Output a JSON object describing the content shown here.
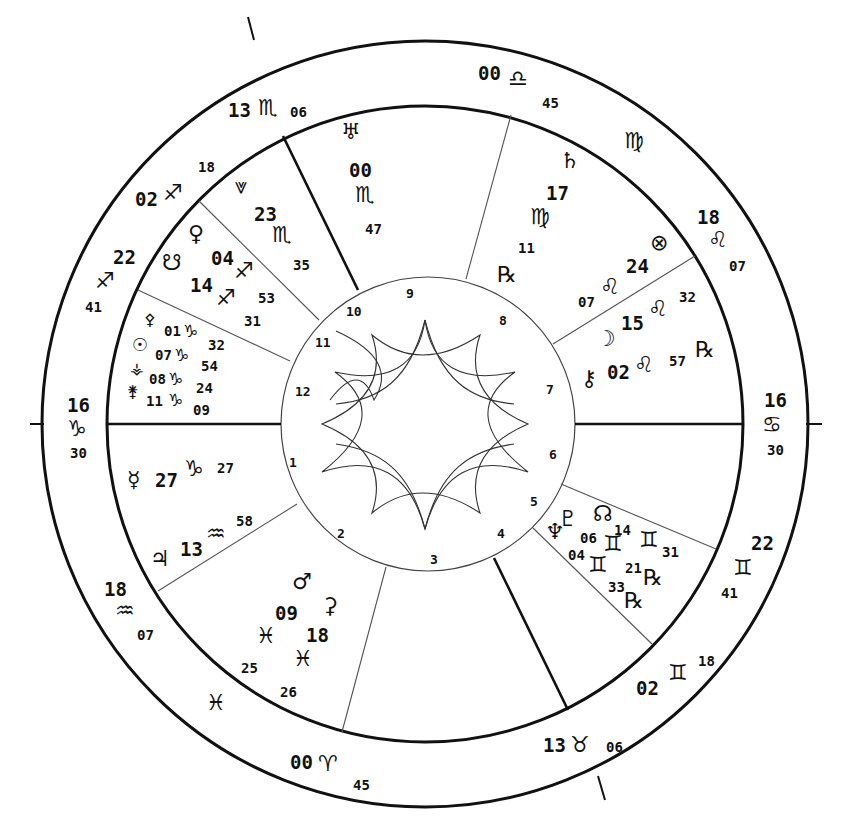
{
  "chart_title": "Natal astrology wheel",
  "colors": {
    "ink": "#111111",
    "background": "#ffffff",
    "thin_line": "#555555"
  },
  "angles": {
    "asc": {
      "deg": "16",
      "sign": "♑",
      "min": "30"
    },
    "dsc": {
      "deg": "16",
      "sign": "♋",
      "min": "30"
    },
    "mc": {
      "deg": "13",
      "sign": "♏",
      "min": "06"
    },
    "ic": {
      "deg": "13",
      "sign": "♉",
      "min": "06"
    }
  },
  "cusps": {
    "c11": {
      "deg": "02",
      "sign": "♐",
      "min": "18"
    },
    "c12": {
      "deg": "22",
      "sign": "♐",
      "min": "41"
    },
    "c2": {
      "deg": "18",
      "sign": "♒",
      "min": "07"
    },
    "c3": {
      "deg": "00",
      "sign": "♈",
      "min": "45"
    },
    "c5": {
      "deg": "02",
      "sign": "♊",
      "min": "18"
    },
    "c6": {
      "deg": "22",
      "sign": "♊",
      "min": "41"
    },
    "c8": {
      "deg": "18",
      "sign": "♌",
      "min": "07"
    },
    "c9": {
      "deg": "00",
      "sign": "♎",
      "min": "45"
    }
  },
  "intercepted_signs": {
    "virgo": "♍",
    "pisces": "♓"
  },
  "house_numbers": [
    "1",
    "2",
    "3",
    "4",
    "5",
    "6",
    "7",
    "8",
    "9",
    "10",
    "11",
    "12"
  ],
  "planets": {
    "uranus": {
      "glyph": "♅",
      "deg": "00",
      "sign": "♏",
      "min": "47"
    },
    "vertex": {
      "glyph": "⩔",
      "deg": "23",
      "sign": "♏",
      "min": "35"
    },
    "venus": {
      "glyph": "♀",
      "deg": "04",
      "sign": "♐",
      "min": "53"
    },
    "south_node": {
      "glyph": "☋",
      "deg": "14",
      "sign": "♐",
      "min": "31"
    },
    "pallas": {
      "glyph": "⚴",
      "deg": "01",
      "sign": "♑",
      "min": "32"
    },
    "sun": {
      "glyph": "☉",
      "deg": "07",
      "sign": "♑",
      "min": "54"
    },
    "vesta": {
      "glyph": "⚶",
      "deg": "08",
      "sign": "♑",
      "min": "24"
    },
    "juno": {
      "glyph": "⚵",
      "deg": "11",
      "sign": "♑",
      "min": "09"
    },
    "mercury": {
      "glyph": "☿",
      "deg": "27",
      "sign": "♑",
      "min": "27"
    },
    "jupiter": {
      "glyph": "♃",
      "deg": "13",
      "sign": "♒",
      "min": "58"
    },
    "mars": {
      "glyph": "♂",
      "deg": "09",
      "sign": "♓",
      "min": "25"
    },
    "ceres": {
      "glyph": "⚳",
      "deg": "18",
      "sign": "♓",
      "min": "26"
    },
    "neptune": {
      "glyph": "♆",
      "deg": "04",
      "sign": "♊",
      "min": "33",
      "retro": "℞"
    },
    "pluto": {
      "glyph": "♇",
      "deg": "06",
      "sign": "♊",
      "min": "21",
      "retro": "℞"
    },
    "north_node": {
      "glyph": "☊",
      "deg": "14",
      "sign": "♊",
      "min": "31"
    },
    "chiron": {
      "glyph": "⚷",
      "deg": "02",
      "sign": "♌",
      "min": "57",
      "retro": "℞"
    },
    "moon": {
      "glyph": "☽",
      "deg": "15",
      "sign": "♌",
      "min": "32"
    },
    "fortune": {
      "glyph": "⊗",
      "deg": "24",
      "sign": "♌",
      "min": "07"
    },
    "saturn": {
      "glyph": "♄",
      "deg": "17",
      "sign": "♍",
      "min": "11",
      "retro": "℞"
    }
  }
}
